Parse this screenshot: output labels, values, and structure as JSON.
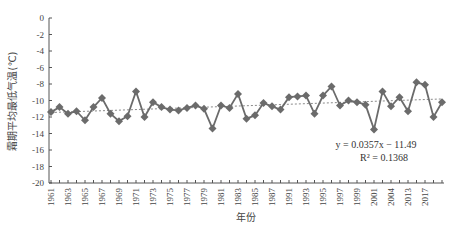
{
  "chart_data": {
    "type": "line",
    "title": "",
    "xlabel": "年份",
    "ylabel": "霜期平均最低气温(℃)",
    "ylim": [
      -20,
      0
    ],
    "yticks": [
      0,
      -2,
      -4,
      -6,
      -8,
      -10,
      -12,
      -14,
      -16,
      -18,
      -20
    ],
    "xtick_labels": [
      "1961",
      "1963",
      "1965",
      "1967",
      "1969",
      "1971",
      "1973",
      "1975",
      "1977",
      "1979",
      "1981",
      "1983",
      "1985",
      "1987",
      "1991",
      "1993",
      "1995",
      "1997",
      "1999",
      "2001",
      "2004",
      "2013",
      "2017"
    ],
    "grid": false,
    "legend": null,
    "series": [
      {
        "name": "霜期平均最低气温",
        "marker": "diamond",
        "color": "#6b6b6b",
        "values": [
          -11.4,
          -10.8,
          -11.6,
          -11.3,
          -12.4,
          -10.8,
          -9.7,
          -11.6,
          -12.5,
          -11.9,
          -8.9,
          -12.0,
          -10.2,
          -10.8,
          -11.1,
          -11.2,
          -10.9,
          -10.6,
          -11.0,
          -13.4,
          -10.6,
          -10.9,
          -9.2,
          -12.2,
          -11.8,
          -10.3,
          -10.7,
          -11.1,
          -9.6,
          -9.5,
          -9.4,
          -11.6,
          -9.4,
          -8.3,
          -10.6,
          -10.0,
          -10.2,
          -10.5,
          -13.5,
          -8.9,
          -10.7,
          -9.6,
          -11.3,
          -7.8,
          -8.1,
          -12.0,
          -10.2
        ]
      }
    ],
    "trendline": {
      "style": "dotted",
      "color": "#8a8a8a",
      "equation": "y = 0.0357x − 11.49",
      "r_squared": "R² = 0.1368",
      "slope": 0.0357,
      "intercept": -11.49
    }
  }
}
